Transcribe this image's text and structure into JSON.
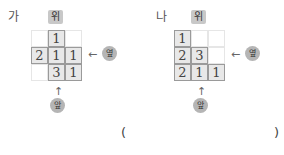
{
  "problems": [
    {
      "label": "가",
      "top_label": "위",
      "side_label": "옆",
      "front_label": "앞",
      "side_arrow": "←",
      "front_arrow": "↑",
      "grid": [
        [
          "",
          "1",
          ""
        ],
        [
          "2",
          "1",
          "1"
        ],
        [
          "",
          "3",
          "1"
        ]
      ]
    },
    {
      "label": "나",
      "top_label": "위",
      "side_label": "옆",
      "front_label": "앞",
      "side_arrow": "←",
      "front_arrow": "↑",
      "grid": [
        [
          "1",
          "",
          ""
        ],
        [
          "2",
          "3",
          ""
        ],
        [
          "2",
          "1",
          "1"
        ]
      ]
    }
  ],
  "answer": {
    "open": "(",
    "close": ")",
    "value": ""
  }
}
